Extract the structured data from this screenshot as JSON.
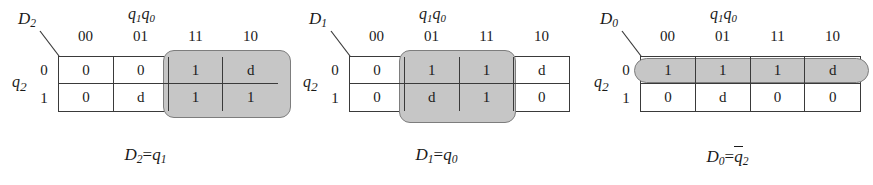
{
  "figure": {
    "background_color": "#ffffff",
    "line_color": "#3a3a3a",
    "highlight_fill": "#c6c6c6",
    "highlight_border": "#7d7d7d"
  },
  "column_variable_label": {
    "base1": "q",
    "sub1": "1",
    "base2": "q",
    "sub2": "0"
  },
  "row_variable_label": {
    "base": "q",
    "sub": "2"
  },
  "column_headers": [
    "00",
    "01",
    "11",
    "10"
  ],
  "row_headers": [
    "0",
    "1"
  ],
  "maps": [
    {
      "id": "kmap-D2",
      "corner_label_base": "D",
      "corner_label_sub": "2",
      "cells": [
        [
          "0",
          "0",
          "1",
          "d"
        ],
        [
          "0",
          "d",
          "1",
          "1"
        ]
      ],
      "groups": [
        {
          "name": "group-q1",
          "cells": "cols 11,10 both rows",
          "left": 163,
          "top": 50,
          "width": 128,
          "height": 68
        }
      ],
      "formula": {
        "lhs_base": "D",
        "lhs_sub": "2",
        "operator": "=",
        "rhs_base": "q",
        "rhs_sub": "1",
        "rhs_overbar": false,
        "text": "D2=q1"
      }
    },
    {
      "id": "kmap-D1",
      "corner_label_base": "D",
      "corner_label_sub": "1",
      "cells": [
        [
          "0",
          "1",
          "1",
          "d"
        ],
        [
          "0",
          "d",
          "1",
          "0"
        ]
      ],
      "groups": [
        {
          "name": "group-q0",
          "cells": "cols 01,11 both rows",
          "left": 108,
          "top": 50,
          "width": 117,
          "height": 73
        }
      ],
      "formula": {
        "lhs_base": "D",
        "lhs_sub": "1",
        "operator": "=",
        "rhs_base": "q",
        "rhs_sub": "0",
        "rhs_overbar": false,
        "text": "D1=q0"
      }
    },
    {
      "id": "kmap-D0",
      "corner_label_base": "D",
      "corner_label_sub": "0",
      "cells": [
        [
          "1",
          "1",
          "1",
          "d"
        ],
        [
          "0",
          "d",
          "0",
          "0"
        ]
      ],
      "groups": [
        {
          "name": "group-q2-bar",
          "cells": "row 0 all columns",
          "left": 52,
          "top": 58,
          "width": 235,
          "height": 25
        }
      ],
      "formula": {
        "lhs_base": "D",
        "lhs_sub": "0",
        "operator": "=",
        "rhs_base": "q",
        "rhs_sub": "2",
        "rhs_overbar": true,
        "text": "D0=q2-bar"
      }
    }
  ]
}
